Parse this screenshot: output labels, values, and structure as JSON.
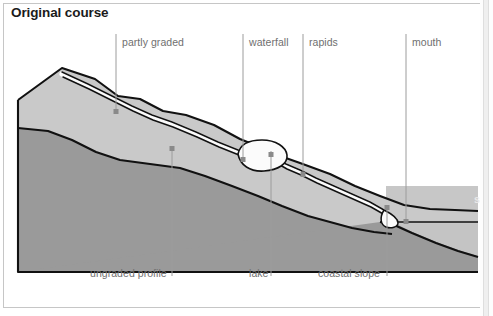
{
  "figure": {
    "title": "Original course",
    "sea_label": "sea",
    "top_labels": [
      {
        "text": "partly graded",
        "x": 122,
        "y": 36,
        "line_x": 116,
        "line_top": 34,
        "line_bottom": 112
      },
      {
        "text": "waterfall",
        "x": 249,
        "y": 36,
        "line_x": 243,
        "line_top": 34,
        "line_bottom": 160
      },
      {
        "text": "rapids",
        "x": 309,
        "y": 36,
        "line_x": 303,
        "line_top": 34,
        "line_bottom": 175
      },
      {
        "text": "mouth",
        "x": 412,
        "y": 36,
        "line_x": 406,
        "line_top": 34,
        "line_bottom": 222
      }
    ],
    "bottom_labels": [
      {
        "text": "ungraded profile",
        "x": 90,
        "y": 267,
        "line_x": 172,
        "line_top": 148,
        "line_bottom": 276
      },
      {
        "text": "lake",
        "x": 249,
        "y": 267,
        "line_x": 271,
        "line_top": 151,
        "line_bottom": 276
      },
      {
        "text": "coastal slope",
        "x": 318,
        "y": 267,
        "line_x": 387,
        "line_top": 207,
        "line_bottom": 276
      }
    ],
    "colors": {
      "background": "#ffffff",
      "frame_border": "#c6c6c6",
      "title_text": "#1b1b1b",
      "label_text": "#6f6f6f",
      "leader_line": "#9c9c9c",
      "leader_dot": "#8a8a8a",
      "base_rock": "#9a9a9a",
      "mid_layer": "#b4b4b4",
      "upper_layer": "#c9c9c9",
      "sea_water": "#c4c4c4",
      "coastal_slope": "#a2a2a2",
      "river_white": "#fbfbfb",
      "outline": "#111111",
      "sea_text": "#e9e9e9"
    },
    "geometry": {
      "ridge_crest": "18,100 62,68 95,79 118,96 140,99 163,111 186,115 214,125 240,139 262,148 283,157 300,163 330,174 355,186 380,196 404,205 430,209 455,210 478,211",
      "mid_contour": "18,128 48,131 72,140 96,152 120,160 150,164 180,168 205,176 232,186 258,196 282,206 308,216 330,222 352,228 374,232 392,234",
      "wedge_base": "18,100 18,272 392,272 392,234",
      "river_course": "62,74 88,86 108,96 132,108 152,117 172,124 196,134 218,144 238,152 252,155 272,158 286,166 300,172 316,180 334,188 352,196 370,204 384,212 392,222",
      "lake_shape": "238,152 246,145 258,143 272,144 282,150 284,158 276,166 262,169 248,166 240,160",
      "sea_surface_y": 222,
      "sea_right_x": 478,
      "coast_floor": "392,222 412,232 436,242 458,250 478,256"
    }
  }
}
